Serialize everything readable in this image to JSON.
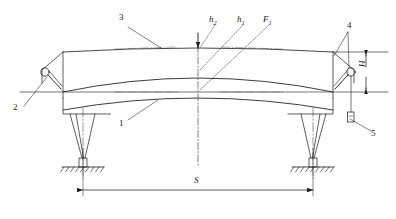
{
  "figure": {
    "type": "engineering-line-drawing",
    "stroke_color": "#1a1a1a",
    "background": "#ffffff"
  },
  "callouts": [
    {
      "id": "1",
      "label": "1",
      "x": 122,
      "y": 124,
      "target": "lower-girder-curve"
    },
    {
      "id": "2",
      "label": "2",
      "x": 15,
      "y": 108,
      "target": "left-hinge-joint"
    },
    {
      "id": "3",
      "label": "3",
      "x": 122,
      "y": 18,
      "target": "top-girder-line"
    },
    {
      "id": "4",
      "label": "4",
      "x": 350,
      "y": 25,
      "target": "right-hinge-joint"
    },
    {
      "id": "5",
      "label": "5",
      "x": 374,
      "y": 134,
      "target": "pendant-control-box"
    }
  ],
  "dimensions": [
    {
      "id": "S",
      "label": "S",
      "x": 194,
      "y": 183,
      "meaning": "span between supports"
    },
    {
      "id": "H",
      "label": "H",
      "x": 364,
      "y": 67,
      "meaning": "girder height"
    }
  ],
  "annotations": [
    {
      "id": "h2",
      "base": "h",
      "sub": "2",
      "x": 213,
      "y": 17,
      "target": "top-reference-line"
    },
    {
      "id": "h1",
      "base": "h",
      "sub": "1",
      "x": 241,
      "y": 17,
      "target": "camber-curve-apex"
    },
    {
      "id": "F1",
      "base": "F",
      "sub": "1",
      "x": 267,
      "y": 17,
      "target": "applied-load-centerline"
    }
  ],
  "parts": {
    "top_girder": "top-girder-line",
    "camber_curve": "camber-curve",
    "lower_curve": "lower-girder-curve",
    "left_support": "left-support-leg",
    "right_support": "right-support-leg",
    "left_ground": "left-ground-symbol",
    "right_ground": "right-ground-symbol",
    "centerline": "vertical-centerline",
    "load_arrow": "load-arrow"
  }
}
